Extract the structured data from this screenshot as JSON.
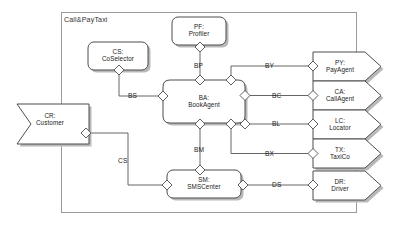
{
  "diagram": {
    "type": "component-diagram",
    "frame": {
      "title_prefix": "C",
      "title": "CALL&PAYTAXI",
      "title_display": "Call&PayTaxi"
    },
    "colors": {
      "stroke": "#4d4d4d",
      "fill": "#ffffff",
      "shadow": "#b3b3b3",
      "text": "#1a1a1a",
      "frame_stroke": "#999999"
    },
    "nodes": [
      {
        "id": "CR",
        "name": "CR:",
        "label": "Customer",
        "shape": "flag",
        "x": 14,
        "y": 101,
        "w": 72,
        "h": 40
      },
      {
        "id": "CS",
        "name": "CS:",
        "label": "CoSelector",
        "shape": "rounded",
        "x": 88,
        "y": 42,
        "w": 62,
        "h": 30
      },
      {
        "id": "PF",
        "name": "PF:",
        "label": "Profiler",
        "shape": "rounded",
        "x": 172,
        "y": 17,
        "w": 56,
        "h": 30
      },
      {
        "id": "BA",
        "name": "BA:",
        "label": "BookAgent",
        "shape": "cloudrect",
        "x": 163,
        "y": 75,
        "w": 82,
        "h": 53
      },
      {
        "id": "SM",
        "name": "SM:",
        "label": "SMSCenter",
        "shape": "rounded",
        "x": 167,
        "y": 170,
        "w": 76,
        "h": 30
      },
      {
        "id": "PY",
        "name": "PY:",
        "label": "PayAgent",
        "shape": "pentagon",
        "x": 313,
        "y": 52,
        "w": 68,
        "h": 29
      },
      {
        "id": "CA",
        "name": "CA:",
        "label": "CallAgent",
        "shape": "pentagon",
        "x": 313,
        "y": 81,
        "w": 68,
        "h": 29
      },
      {
        "id": "LC",
        "name": "LC:",
        "label": "Locator",
        "shape": "pentagon",
        "x": 313,
        "y": 110,
        "w": 68,
        "h": 29
      },
      {
        "id": "TX",
        "name": "TX:",
        "label": "TaxiCo",
        "shape": "pentagon",
        "x": 313,
        "y": 139,
        "w": 68,
        "h": 29
      },
      {
        "id": "DR",
        "name": "DR:",
        "label": "Driver",
        "shape": "pentagon",
        "x": 313,
        "y": 171,
        "w": 68,
        "h": 29
      }
    ],
    "connectors": [
      {
        "id": "BP",
        "label": "BP",
        "from": "PF",
        "to": "BA"
      },
      {
        "id": "BS",
        "label": "BS",
        "from": "CS",
        "to": "BA"
      },
      {
        "id": "BY",
        "label": "BY",
        "from": "BA",
        "to": "PY"
      },
      {
        "id": "BC",
        "label": "BC",
        "from": "BA",
        "to": "CA"
      },
      {
        "id": "BL",
        "label": "BL",
        "from": "BA",
        "to": "LC"
      },
      {
        "id": "BX",
        "label": "BX",
        "from": "BA",
        "to": "TX"
      },
      {
        "id": "BM",
        "label": "BM",
        "from": "BA",
        "to": "SM"
      },
      {
        "id": "CS",
        "label": "CS",
        "from": "CR",
        "to": "SM"
      },
      {
        "id": "DS",
        "label": "DS",
        "from": "SM",
        "to": "DR"
      }
    ]
  }
}
